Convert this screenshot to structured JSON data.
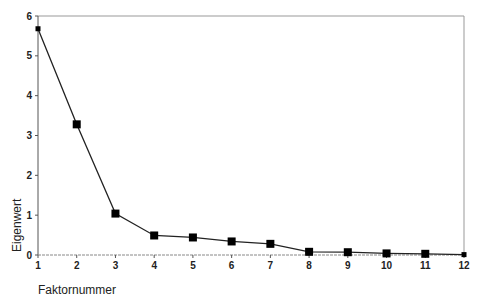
{
  "chart_data": {
    "type": "line",
    "title": "",
    "xlabel": "Faktornummer",
    "ylabel": "Eigenwert",
    "x": [
      1,
      2,
      3,
      4,
      5,
      6,
      7,
      8,
      9,
      10,
      11,
      12
    ],
    "values": [
      5.68,
      3.28,
      1.04,
      0.49,
      0.44,
      0.34,
      0.28,
      0.08,
      0.07,
      0.04,
      0.03,
      0.01
    ],
    "xlim": [
      1,
      12
    ],
    "ylim": [
      0,
      6
    ],
    "yticks": [
      0,
      1,
      2,
      3,
      4,
      5,
      6
    ],
    "xticks": [
      1,
      2,
      3,
      4,
      5,
      6,
      7,
      8,
      9,
      10,
      11,
      12
    ],
    "grid": false,
    "legend": null,
    "marker": "square",
    "line_color": "#222222",
    "marker_color": "#000000"
  }
}
